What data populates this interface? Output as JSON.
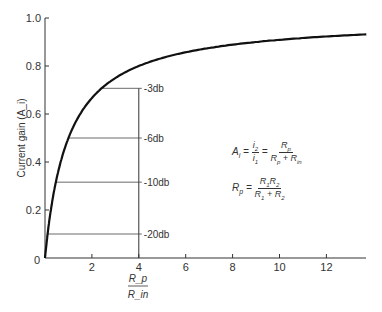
{
  "chart_data": {
    "type": "line",
    "title": "",
    "xlabel": "Rp / Rin",
    "xlabel_num": "R_p",
    "xlabel_den": "R_in",
    "ylabel": "Current gain (A_i)",
    "xlim": [
      0,
      13.8
    ],
    "ylim": [
      0,
      1.0
    ],
    "grid": false,
    "x_ticks": [
      "0",
      "2",
      "4",
      "6",
      "8",
      "10",
      "12"
    ],
    "y_ticks": [
      "0.2",
      "0.4",
      "0.6",
      "0.8",
      "1.0"
    ],
    "series": [
      {
        "name": "A_i = Rp/(Rp+Rin)",
        "formula": "x/(x+1)",
        "x": [
          0,
          0.25,
          0.5,
          1,
          1.5,
          2,
          2.41,
          3,
          4,
          5,
          6,
          8,
          10,
          12,
          13.7
        ],
        "values": [
          0,
          0.2,
          0.333,
          0.5,
          0.6,
          0.667,
          0.707,
          0.75,
          0.8,
          0.833,
          0.857,
          0.889,
          0.909,
          0.923,
          0.932
        ]
      }
    ],
    "annotations": [
      {
        "label": "-3 db",
        "y": 0.707
      },
      {
        "label": "-6 db",
        "y": 0.5
      },
      {
        "label": "-10 db",
        "y": 0.316
      },
      {
        "label": "-20 db",
        "y": 0.1
      }
    ],
    "equations": {
      "ai": "A_i = i2/i1 = Rp/(Rp + Rin)",
      "rp": "Rp = R1R2/(R1 + R2)"
    }
  }
}
